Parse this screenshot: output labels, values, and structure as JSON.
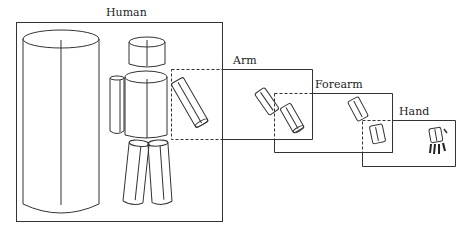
{
  "diagram": {
    "type": "hierarchical-zoom",
    "levels": [
      {
        "id": "human",
        "label": "Human"
      },
      {
        "id": "arm",
        "label": "Arm"
      },
      {
        "id": "forearm",
        "label": "Forearm"
      },
      {
        "id": "hand",
        "label": "Hand"
      }
    ],
    "colors": {
      "line": "#333333",
      "background": "#ffffff"
    }
  }
}
